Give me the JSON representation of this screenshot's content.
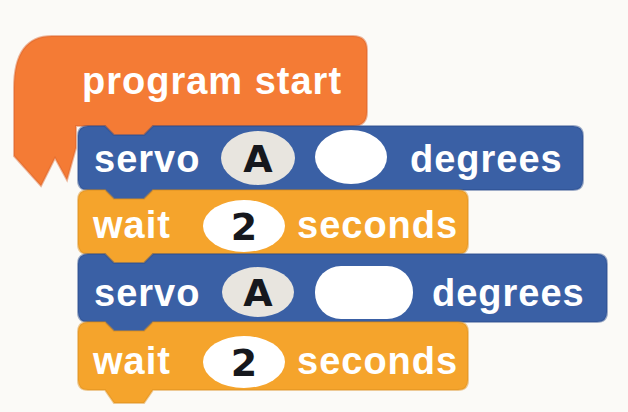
{
  "window": {
    "background": "#fbfaf7"
  },
  "palette": {
    "program_start_fill": "#f47b35",
    "program_start_edge": "#d9622a",
    "servo_fill": "#3a60a5",
    "servo_edge": "#2a4c8c",
    "wait_fill": "#f5a42c",
    "wait_edge": "#db8d1c",
    "port_slot_fill": "#e8e5df",
    "value_slot_fill": "#ffffff",
    "label_color": "#ffffff",
    "slot_text_color": "#16181d"
  },
  "blocks": {
    "program_start": {
      "label": "program start"
    },
    "servo_1": {
      "keyword": "servo",
      "port": "A",
      "angle": "",
      "unit": "degrees"
    },
    "wait_1": {
      "keyword": "wait",
      "duration": "2",
      "unit": "seconds"
    },
    "servo_2": {
      "keyword": "servo",
      "port": "A",
      "angle": "",
      "unit": "degrees"
    },
    "wait_2": {
      "keyword": "wait",
      "duration": "2",
      "unit": "seconds"
    }
  }
}
